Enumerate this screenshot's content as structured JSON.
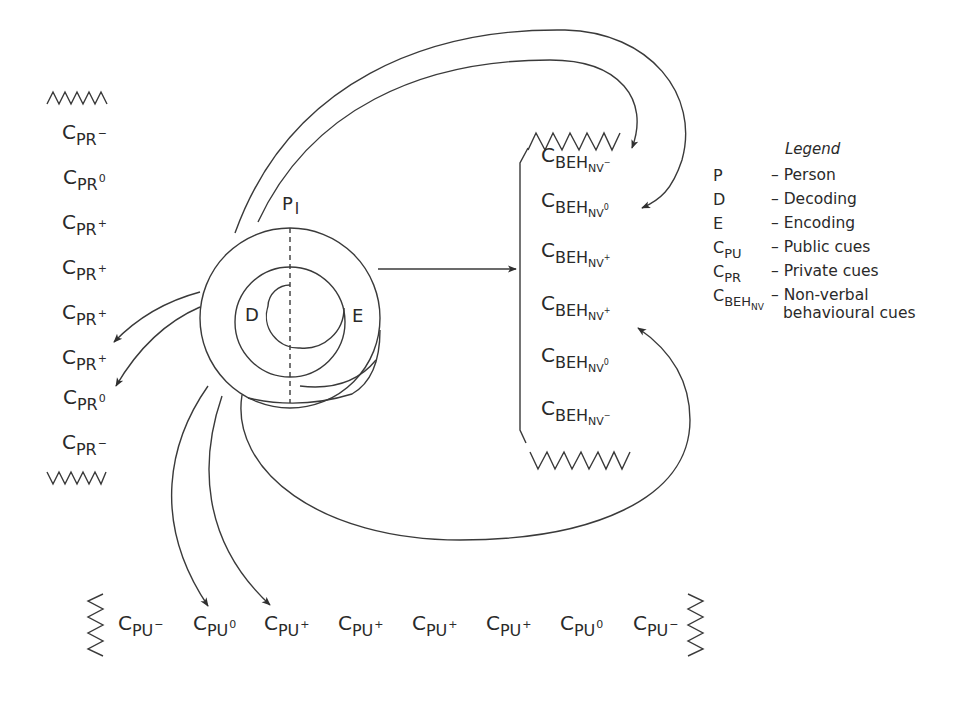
{
  "diagram": {
    "person_label": "P",
    "person_index": "I",
    "decoding_label": "D",
    "encoding_label": "E"
  },
  "private_cues": [
    {
      "base": "C",
      "sub": "PR",
      "sup": "−"
    },
    {
      "base": "C",
      "sub": "PR",
      "sup": "0"
    },
    {
      "base": "C",
      "sub": "PR",
      "sup": "+"
    },
    {
      "base": "C",
      "sub": "PR",
      "sup": "+"
    },
    {
      "base": "C",
      "sub": "PR",
      "sup": "+"
    },
    {
      "base": "C",
      "sub": "PR",
      "sup": "+"
    },
    {
      "base": "C",
      "sub": "PR",
      "sup": "0"
    },
    {
      "base": "C",
      "sub": "PR",
      "sup": "−"
    }
  ],
  "behavioural_cues": [
    {
      "base": "C",
      "sub": "BEH",
      "sub2": "NV",
      "sup": "−"
    },
    {
      "base": "C",
      "sub": "BEH",
      "sub2": "NV",
      "sup": "0"
    },
    {
      "base": "C",
      "sub": "BEH",
      "sub2": "NV",
      "sup": "+"
    },
    {
      "base": "C",
      "sub": "BEH",
      "sub2": "NV",
      "sup": "+"
    },
    {
      "base": "C",
      "sub": "BEH",
      "sub2": "NV",
      "sup": "0"
    },
    {
      "base": "C",
      "sub": "BEH",
      "sub2": "NV",
      "sup": "−"
    }
  ],
  "public_cues": [
    {
      "base": "C",
      "sub": "PU",
      "sup": "−"
    },
    {
      "base": "C",
      "sub": "PU",
      "sup": "0"
    },
    {
      "base": "C",
      "sub": "PU",
      "sup": "+"
    },
    {
      "base": "C",
      "sub": "PU",
      "sup": "+"
    },
    {
      "base": "C",
      "sub": "PU",
      "sup": "+"
    },
    {
      "base": "C",
      "sub": "PU",
      "sup": "+"
    },
    {
      "base": "C",
      "sub": "PU",
      "sup": "0"
    },
    {
      "base": "C",
      "sub": "PU",
      "sup": "−"
    }
  ],
  "legend": {
    "title": "Legend",
    "items": [
      {
        "key": "P",
        "value": "– Person"
      },
      {
        "key": "D",
        "value": "– Decoding"
      },
      {
        "key": "E",
        "value": "– Encoding"
      },
      {
        "key": "C",
        "key_sub": "PU",
        "value": "– Public cues"
      },
      {
        "key": "C",
        "key_sub": "PR",
        "value": "– Private cues"
      },
      {
        "key": "C",
        "key_sub": "BEH",
        "key_sub2": "NV",
        "value": "– Non-verbal",
        "value2": "behavioural cues"
      }
    ]
  },
  "colors": {
    "stroke": "#3a3a3a",
    "text": "#2a2a2a",
    "background": "#ffffff"
  }
}
